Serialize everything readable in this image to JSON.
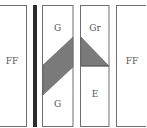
{
  "diagram": {
    "type": "zone-diagram",
    "colors": {
      "border": "#6e6e6e",
      "shade": "#7a7a7a",
      "bar": "#2b2b2b",
      "text": "#555555"
    },
    "panels": [
      {
        "id": "panel-1",
        "labels": [
          "FF"
        ]
      },
      {
        "id": "separator-bar",
        "labels": []
      },
      {
        "id": "panel-2",
        "labels": [
          "G",
          "G"
        ],
        "shape": "parallelogram"
      },
      {
        "id": "panel-3",
        "labels": [
          "Gr",
          "E"
        ],
        "shape": "triangle"
      },
      {
        "id": "panel-4",
        "labels": [
          "FF"
        ]
      }
    ],
    "label_ff_left": "FF",
    "label_g_top": "G",
    "label_g_bottom": "G",
    "label_gr": "Gr",
    "label_e": "E",
    "label_ff_right": "FF"
  }
}
